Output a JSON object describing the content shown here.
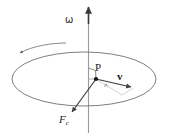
{
  "figure": {
    "background_color": "#ffffff",
    "width": 169,
    "height": 136
  },
  "labels": {
    "omega": "ω",
    "point_p": "P",
    "velocity": "v",
    "force_symbol": "F",
    "force_subscript": "c",
    "angle": "θ"
  },
  "colors": {
    "axis": "#8c8c8c",
    "ellipse": "#6f6f6f",
    "vector": "#4a4a4a",
    "spoke": "#6a6a6a",
    "text": "#222222",
    "guide": "#b5b5b5",
    "point": "#111111"
  },
  "geometry": {
    "axis_x": 88.5,
    "axis_top_y": 6,
    "axis_bottom_y": 133,
    "ellipse_cx": 84,
    "ellipse_cy": 79,
    "ellipse_rx": 72,
    "ellipse_ry": 27,
    "point_p_x": 96,
    "point_p_y": 79,
    "velocity_tip_x": 132,
    "velocity_tip_y": 87,
    "force_tip_x": 71,
    "force_tip_y": 113,
    "spin_arrow_tip_x": 19,
    "spin_arrow_tip_y": 53
  },
  "annotations": {
    "right_angle_marker": "right-angle between rotation axis and radius at P",
    "rotation_direction": "counter-clockwise as seen from above"
  }
}
